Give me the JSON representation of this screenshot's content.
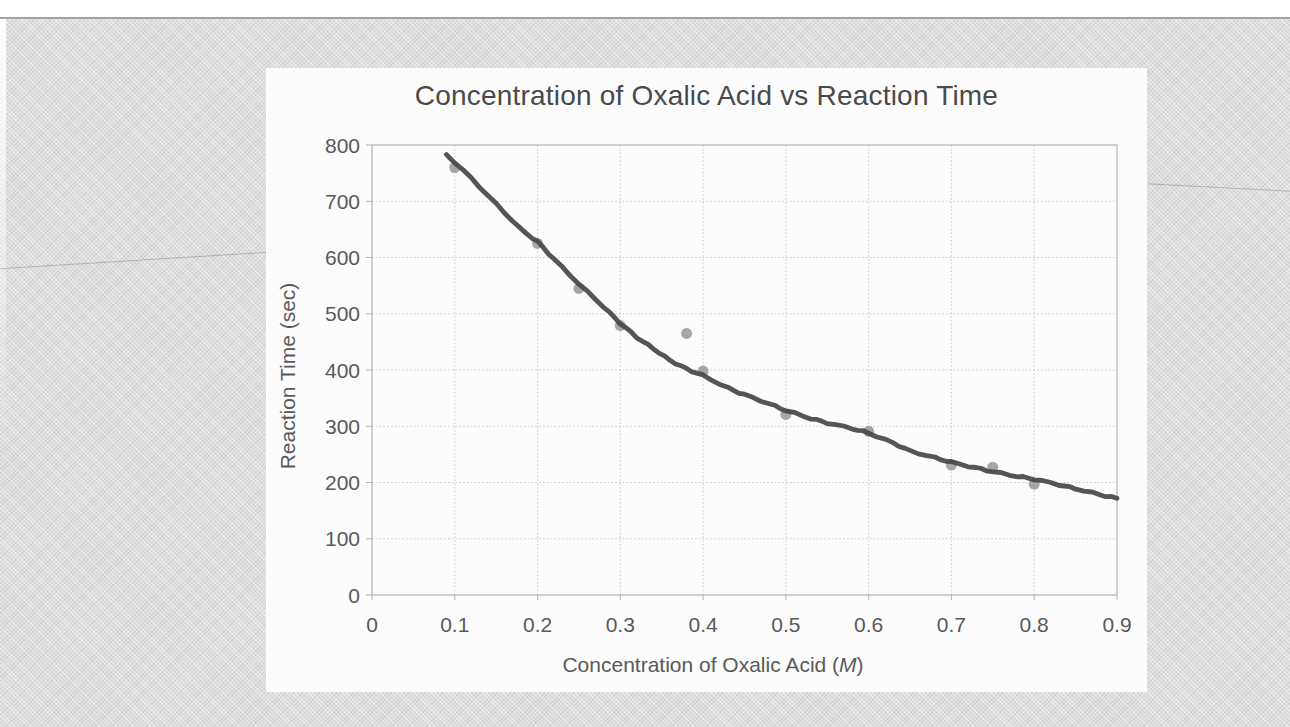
{
  "page": {
    "kind": "scanned-book-figure",
    "paper_color": "#dedede",
    "card_color": "#fcfcfc"
  },
  "chart_data": {
    "type": "scatter",
    "title": "Concentration of Oxalic Acid vs Reaction Time",
    "xlabel": "Concentration of Oxalic Acid (M)",
    "xlabel_parts": {
      "prefix": "Concentration of Oxalic Acid (",
      "italic": "M",
      "suffix": ")"
    },
    "ylabel": "Reaction Time (sec)",
    "xlim": [
      0,
      0.9
    ],
    "ylim": [
      0,
      800
    ],
    "x_ticks": [
      0,
      0.1,
      0.2,
      0.3,
      0.4,
      0.5,
      0.6,
      0.7,
      0.8,
      0.9
    ],
    "x_tick_labels": [
      "0",
      "0.1",
      "0.2",
      "0.3",
      "0.4",
      "0.5",
      "0.6",
      "0.7",
      "0.8",
      "0.9"
    ],
    "y_ticks": [
      0,
      100,
      200,
      300,
      400,
      500,
      600,
      700,
      800
    ],
    "y_tick_labels": [
      "0",
      "100",
      "200",
      "300",
      "400",
      "500",
      "600",
      "700",
      "800"
    ],
    "grid": true,
    "legend": "none",
    "series": [
      {
        "name": "measured-points",
        "kind": "scatter",
        "points": [
          [
            0.1,
            760
          ],
          [
            0.2,
            625
          ],
          [
            0.25,
            545
          ],
          [
            0.3,
            479
          ],
          [
            0.38,
            465
          ],
          [
            0.4,
            398
          ],
          [
            0.5,
            321
          ],
          [
            0.6,
            291
          ],
          [
            0.7,
            231
          ],
          [
            0.75,
            227
          ],
          [
            0.8,
            197
          ]
        ]
      },
      {
        "name": "trend-line",
        "kind": "line",
        "points": [
          [
            0.09,
            783
          ],
          [
            0.12,
            741
          ],
          [
            0.15,
            695
          ],
          [
            0.18,
            650
          ],
          [
            0.2,
            628
          ],
          [
            0.22,
            597
          ],
          [
            0.25,
            553
          ],
          [
            0.28,
            512
          ],
          [
            0.3,
            483
          ],
          [
            0.32,
            458
          ],
          [
            0.34,
            438
          ],
          [
            0.36,
            417
          ],
          [
            0.38,
            402
          ],
          [
            0.4,
            390
          ],
          [
            0.43,
            368
          ],
          [
            0.45,
            356
          ],
          [
            0.48,
            340
          ],
          [
            0.5,
            328
          ],
          [
            0.53,
            314
          ],
          [
            0.55,
            306
          ],
          [
            0.58,
            296
          ],
          [
            0.6,
            288
          ],
          [
            0.63,
            270
          ],
          [
            0.65,
            256
          ],
          [
            0.68,
            244
          ],
          [
            0.7,
            236
          ],
          [
            0.73,
            226
          ],
          [
            0.75,
            219
          ],
          [
            0.78,
            211
          ],
          [
            0.8,
            206
          ],
          [
            0.83,
            196
          ],
          [
            0.85,
            189
          ],
          [
            0.88,
            178
          ],
          [
            0.9,
            172
          ]
        ]
      }
    ],
    "colors": {
      "point": "#9a9a9a",
      "line": "#484848",
      "grid": "#cccccc",
      "axis_box": "#b2b2b2",
      "tick_text": "#595959",
      "title_text": "#4a4a4a"
    }
  }
}
